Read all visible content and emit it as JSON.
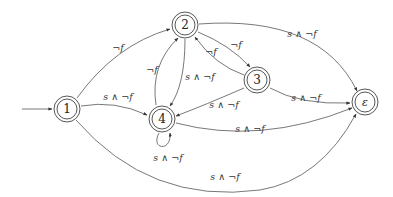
{
  "diagram": {
    "type": "state-machine",
    "nodes": [
      {
        "id": "1",
        "label": "1",
        "x": 67,
        "y": 109,
        "accepting": true,
        "initial": true
      },
      {
        "id": "2",
        "label": "2",
        "x": 185,
        "y": 25,
        "accepting": true
      },
      {
        "id": "3",
        "label": "3",
        "x": 257,
        "y": 80,
        "accepting": true
      },
      {
        "id": "4",
        "label": "4",
        "x": 162,
        "y": 119,
        "accepting": true
      },
      {
        "id": "eps",
        "label": "ε",
        "x": 365,
        "y": 102,
        "accepting": true
      }
    ],
    "edges": [
      {
        "from": "1",
        "to": "2",
        "label": "¬f"
      },
      {
        "from": "1",
        "to": "4",
        "label": "s ∧ ¬f"
      },
      {
        "from": "1",
        "to": "eps",
        "label": "s ∧ ¬f"
      },
      {
        "from": "2",
        "to": "3",
        "label": "¬f"
      },
      {
        "from": "3",
        "to": "2",
        "label": "¬f"
      },
      {
        "from": "4",
        "to": "2",
        "label": "¬f"
      },
      {
        "from": "2",
        "to": "4",
        "label": "s ∧ ¬f"
      },
      {
        "from": "2",
        "to": "eps",
        "label": "s ∧ ¬f"
      },
      {
        "from": "3",
        "to": "4",
        "label": "s ∧ ¬f"
      },
      {
        "from": "3",
        "to": "eps",
        "label": "s ∧ ¬f"
      },
      {
        "from": "4",
        "to": "eps",
        "label": "s ∧ ¬f"
      },
      {
        "from": "4",
        "to": "4",
        "label": "s ∧ ¬f"
      }
    ]
  },
  "labels": {
    "n1": "1",
    "n2": "2",
    "n3": "3",
    "n4": "4",
    "neps": "ε",
    "e_1_2": "¬f",
    "e_1_4": "s ∧ ¬f",
    "e_1_eps": "s ∧ ¬f",
    "e_2_3": "¬f",
    "e_3_2": "¬f",
    "e_4_2": "¬f",
    "e_2_4": "s ∧ ¬f",
    "e_2_eps": "s ∧ ¬f",
    "e_3_4": "s ∧ ¬f",
    "e_3_eps": "s ∧ ¬f",
    "e_4_eps": "s ∧ ¬f",
    "e_4_4": "s ∧ ¬f"
  }
}
